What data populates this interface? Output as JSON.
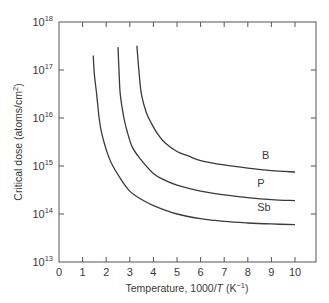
{
  "chart_data": {
    "type": "line",
    "title": "",
    "xlabel": "Temperature, 1000/T (K⁻¹)",
    "xlabel_parts": {
      "prefix": "Temperature, 1000/",
      "italic": "T",
      "suffix": " (K",
      "sup": "−1",
      "close": ")"
    },
    "ylabel": "Critical dose (atoms/cm²)",
    "ylabel_parts": {
      "main": "Critical dose (atoms/cm",
      "sup": "2",
      "close": ")"
    },
    "xlim": [
      0,
      11
    ],
    "ylim": [
      10000000000000.0,
      1e+18
    ],
    "yscale": "log",
    "grid": false,
    "legend": "inline labels at curve ends",
    "x_ticks": [
      0,
      1,
      2,
      3,
      4,
      5,
      6,
      7,
      8,
      9,
      10
    ],
    "y_ticks": [
      {
        "base": "10",
        "exp": "13",
        "value": 10000000000000.0
      },
      {
        "base": "10",
        "exp": "14",
        "value": 100000000000000.0
      },
      {
        "base": "10",
        "exp": "15",
        "value": 1000000000000000.0
      },
      {
        "base": "10",
        "exp": "16",
        "value": 1e+16
      },
      {
        "base": "10",
        "exp": "17",
        "value": 1e+17
      },
      {
        "base": "10",
        "exp": "18",
        "value": 1e+18
      }
    ],
    "series": [
      {
        "name": "B",
        "label_at": [
          8.6,
          1400000000000000.0
        ],
        "points": [
          [
            3.3,
            3.2e+17
          ],
          [
            3.4,
            8e+16
          ],
          [
            3.5,
            3e+16
          ],
          [
            3.7,
            1.3e+16
          ],
          [
            3.9,
            8000000000000000.0
          ],
          [
            4.2,
            4500000000000000.0
          ],
          [
            4.5,
            3000000000000000.0
          ],
          [
            5.0,
            2000000000000000.0
          ],
          [
            5.5,
            1600000000000000.0
          ],
          [
            6.0,
            1300000000000000.0
          ],
          [
            7.0,
            1050000000000000.0
          ],
          [
            8.0,
            900000000000000.0
          ],
          [
            9.0,
            800000000000000.0
          ],
          [
            10.0,
            750000000000000.0
          ]
        ]
      },
      {
        "name": "P",
        "label_at": [
          8.4,
          360000000000000.0
        ],
        "points": [
          [
            2.5,
            3e+17
          ],
          [
            2.55,
            8e+16
          ],
          [
            2.6,
            3e+16
          ],
          [
            2.75,
            1e+16
          ],
          [
            2.9,
            5000000000000000.0
          ],
          [
            3.1,
            2500000000000000.0
          ],
          [
            3.4,
            1500000000000000.0
          ],
          [
            4.0,
            700000000000000.0
          ],
          [
            4.5,
            500000000000000.0
          ],
          [
            5.0,
            400000000000000.0
          ],
          [
            6.0,
            300000000000000.0
          ],
          [
            7.0,
            250000000000000.0
          ],
          [
            8.0,
            220000000000000.0
          ],
          [
            9.0,
            200000000000000.0
          ],
          [
            10.0,
            190000000000000.0
          ]
        ]
      },
      {
        "name": "Sb",
        "label_at": [
          8.4,
          115000000000000.0
        ],
        "points": [
          [
            1.45,
            2e+17
          ],
          [
            1.5,
            8e+16
          ],
          [
            1.6,
            3e+16
          ],
          [
            1.7,
            1e+16
          ],
          [
            1.8,
            5000000000000000.0
          ],
          [
            2.0,
            2200000000000000.0
          ],
          [
            2.2,
            1200000000000000.0
          ],
          [
            2.6,
            550000000000000.0
          ],
          [
            3.0,
            300000000000000.0
          ],
          [
            3.5,
            200000000000000.0
          ],
          [
            4.0,
            150000000000000.0
          ],
          [
            5.0,
            100000000000000.0
          ],
          [
            6.0,
            80000000000000.0
          ],
          [
            7.0,
            70000000000000.0
          ],
          [
            8.0,
            65000000000000.0
          ],
          [
            9.0,
            62000000000000.0
          ],
          [
            10.0,
            60000000000000.0
          ]
        ]
      }
    ]
  },
  "style": {
    "axis_color": "#555555",
    "curve_color": "#3a3a3a",
    "text_color": "#3a3a3a",
    "background": "#ffffff"
  }
}
